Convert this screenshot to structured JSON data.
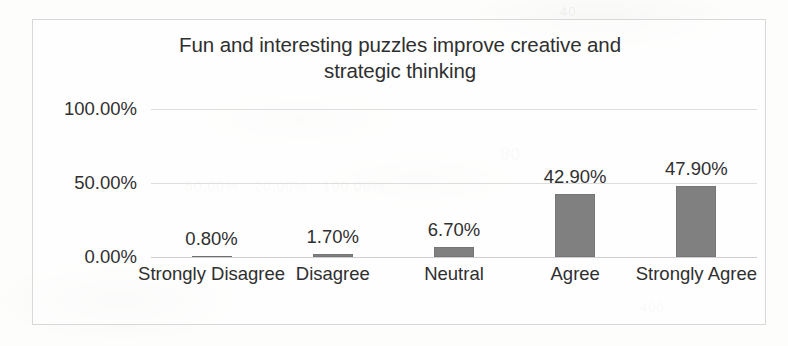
{
  "chart_data": {
    "type": "bar",
    "title": "Fun and interesting puzzles improve creative and strategic thinking",
    "title_line1": "Fun and interesting puzzles improve creative and",
    "title_line2": "strategic thinking",
    "xlabel": "",
    "ylabel": "",
    "categories": [
      "Strongly Disagree",
      "Disagree",
      "Neutral",
      "Agree",
      "Strongly Agree"
    ],
    "values": [
      0.8,
      1.7,
      6.7,
      42.9,
      47.9
    ],
    "data_labels": [
      "0.80%",
      "1.70%",
      "6.70%",
      "42.90%",
      "47.90%"
    ],
    "ylim": [
      0,
      100
    ],
    "y_ticks": [
      0,
      50,
      100
    ],
    "y_tick_labels": [
      "0.00%",
      "50.00%",
      "100.00%"
    ],
    "grid": true,
    "legend": false,
    "bar_color": "#808080",
    "gridline_color": "#dedede",
    "plot_background": "#ffffff",
    "frame_border_color": "#d8d8d8"
  },
  "artifacts": {
    "ghost_texts": [
      "80",
      "50.00%  -  20.00%  -  100.00%",
      "400",
      "40",
      "30"
    ]
  }
}
